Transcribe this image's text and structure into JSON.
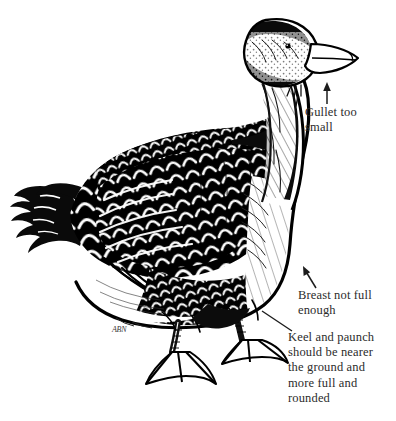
{
  "figure": {
    "style": "black-and-white pen-and-ink engraving",
    "background_color": "#ffffff",
    "ink_color": "#000000"
  },
  "annotations": [
    {
      "id": "gullet",
      "text": "Gullet too\nsmall",
      "pointer": "up-arrow",
      "target": "neck"
    },
    {
      "id": "breast",
      "text": "Breast not full\nenough",
      "pointer": "up-arrow",
      "target": "breast"
    },
    {
      "id": "keel",
      "text": "Keel and paunch\nshould be nearer\nthe ground and\nmore full and\nrounded",
      "pointer": "diagonal-line",
      "target": "keel-paunch"
    }
  ],
  "signature": {
    "initials": "ABN"
  },
  "text_color": "#2b2b2b"
}
